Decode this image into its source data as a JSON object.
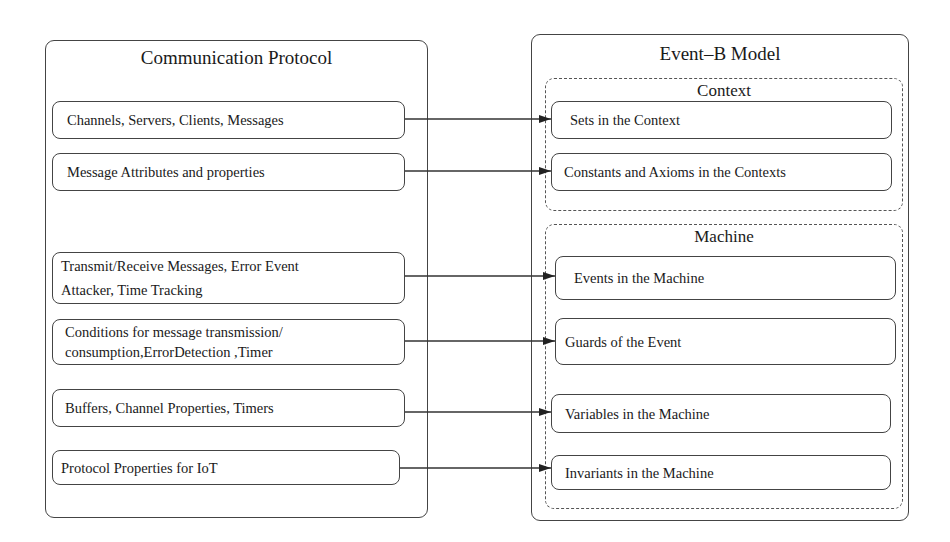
{
  "left": {
    "title": "Communication Protocol",
    "items": [
      {
        "text": "Channels, Servers, Clients, Messages"
      },
      {
        "text": "Message Attributes and properties"
      },
      {
        "line1": "Transmit/Receive Messages, Error Event",
        "line2": "Attacker, Time Tracking"
      },
      {
        "line1": "Conditions for message transmission/",
        "line2": "consumption,ErrorDetection ,Timer"
      },
      {
        "text": "Buffers, Channel Properties, Timers"
      },
      {
        "text": "Protocol Properties for IoT"
      }
    ]
  },
  "right": {
    "title": "Event–B Model",
    "context": {
      "title": "Context",
      "items": [
        {
          "text": "Sets in the Context"
        },
        {
          "text": "Constants and Axioms in the Contexts"
        }
      ]
    },
    "machine": {
      "title": "Machine",
      "items": [
        {
          "text": "Events in the Machine"
        },
        {
          "text": "Guards of the Event"
        },
        {
          "text": "Variables in the Machine"
        },
        {
          "text": "Invariants in the Machine"
        }
      ]
    }
  },
  "mappings": [
    {
      "from": "Channels, Servers, Clients, Messages",
      "to": "Sets in the Context"
    },
    {
      "from": "Message Attributes and properties",
      "to": "Constants and Axioms in the Contexts"
    },
    {
      "from": "Transmit/Receive Messages, Error Event Attacker, Time Tracking",
      "to": "Events in the Machine"
    },
    {
      "from": "Conditions for message transmission/consumption,ErrorDetection ,Timer",
      "to": "Guards of the Event"
    },
    {
      "from": "Buffers, Channel Properties, Timers",
      "to": "Variables in the Machine"
    },
    {
      "from": "Protocol Properties for IoT",
      "to": "Invariants in the Machine"
    }
  ]
}
